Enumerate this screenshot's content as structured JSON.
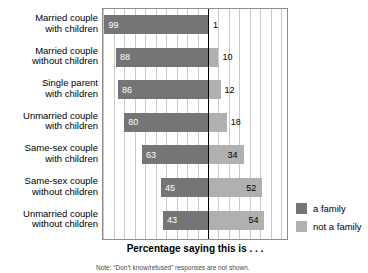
{
  "chart_data": {
    "type": "bar",
    "subtype": "diverging-stacked-bar",
    "title": "",
    "xlabel": "Percentage saying this is . . .",
    "ylabel": "",
    "orientation": "horizontal",
    "grid": true,
    "legend_position": "right",
    "xlim": [
      -100,
      80
    ],
    "categories": [
      "Married couple with children",
      "Married couple without children",
      "Single parent with children",
      "Unmarried couple with children",
      "Same-sex couple with children",
      "Same-sex couple without children",
      "Unmarried couple without children"
    ],
    "category_lines": [
      [
        "Married couple",
        "with children"
      ],
      [
        "Married couple",
        "without children"
      ],
      [
        "Single parent",
        "with children"
      ],
      [
        "Unmarried couple",
        "with children"
      ],
      [
        "Same-sex couple",
        "with children"
      ],
      [
        "Same-sex couple",
        "without children"
      ],
      [
        "Unmarried couple",
        "without children"
      ]
    ],
    "series": [
      {
        "name": "a family",
        "color": "#757575",
        "direction": "left",
        "values": [
          99,
          88,
          86,
          80,
          63,
          45,
          43
        ]
      },
      {
        "name": "not a family",
        "color": "#b0b0b0",
        "direction": "right",
        "values": [
          1,
          10,
          12,
          18,
          34,
          52,
          54
        ]
      }
    ],
    "rows": [
      {
        "category": "Married couple with children",
        "a_family": 99,
        "not_a_family": 1
      },
      {
        "category": "Married couple without children",
        "a_family": 88,
        "not_a_family": 10
      },
      {
        "category": "Single parent with children",
        "a_family": 86,
        "not_a_family": 12
      },
      {
        "category": "Unmarried couple with children",
        "a_family": 80,
        "not_a_family": 18
      },
      {
        "category": "Same-sex couple with children",
        "a_family": 63,
        "not_a_family": 34
      },
      {
        "category": "Same-sex couple without children",
        "a_family": 45,
        "not_a_family": 52
      },
      {
        "category": "Unmarried couple without children",
        "a_family": 43,
        "not_a_family": 54
      }
    ]
  },
  "legend": {
    "items": [
      {
        "label": "a family",
        "color": "#757575"
      },
      {
        "label": "not a family",
        "color": "#b0b0b0"
      }
    ]
  },
  "axis": {
    "title": "Percentage saying this is . . ."
  },
  "footnote": {
    "text": "Note: “Don’t know/refused” responses are not shown."
  }
}
